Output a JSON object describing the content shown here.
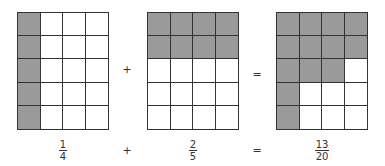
{
  "diagram": {
    "shade_color": "#9a9a9a",
    "grids": [
      {
        "label": "one-quarter",
        "rows": 5,
        "cols": 4,
        "shaded": [
          [
            1,
            0,
            0,
            0
          ],
          [
            1,
            0,
            0,
            0
          ],
          [
            1,
            0,
            0,
            0
          ],
          [
            1,
            0,
            0,
            0
          ],
          [
            1,
            0,
            0,
            0
          ]
        ]
      },
      {
        "label": "two-fifths",
        "rows": 5,
        "cols": 4,
        "shaded": [
          [
            1,
            1,
            1,
            1
          ],
          [
            1,
            1,
            1,
            1
          ],
          [
            0,
            0,
            0,
            0
          ],
          [
            0,
            0,
            0,
            0
          ],
          [
            0,
            0,
            0,
            0
          ]
        ]
      },
      {
        "label": "thirteen-twentieths",
        "rows": 5,
        "cols": 4,
        "shaded": [
          [
            1,
            1,
            1,
            1
          ],
          [
            1,
            1,
            1,
            1
          ],
          [
            1,
            1,
            1,
            0
          ],
          [
            1,
            0,
            0,
            0
          ],
          [
            1,
            0,
            0,
            0
          ]
        ]
      }
    ],
    "operators": {
      "plus": "+",
      "equals": "="
    },
    "fractions": [
      {
        "numerator": "1",
        "denominator": "4"
      },
      {
        "numerator": "2",
        "denominator": "5"
      },
      {
        "numerator": "13",
        "denominator": "20"
      }
    ]
  }
}
